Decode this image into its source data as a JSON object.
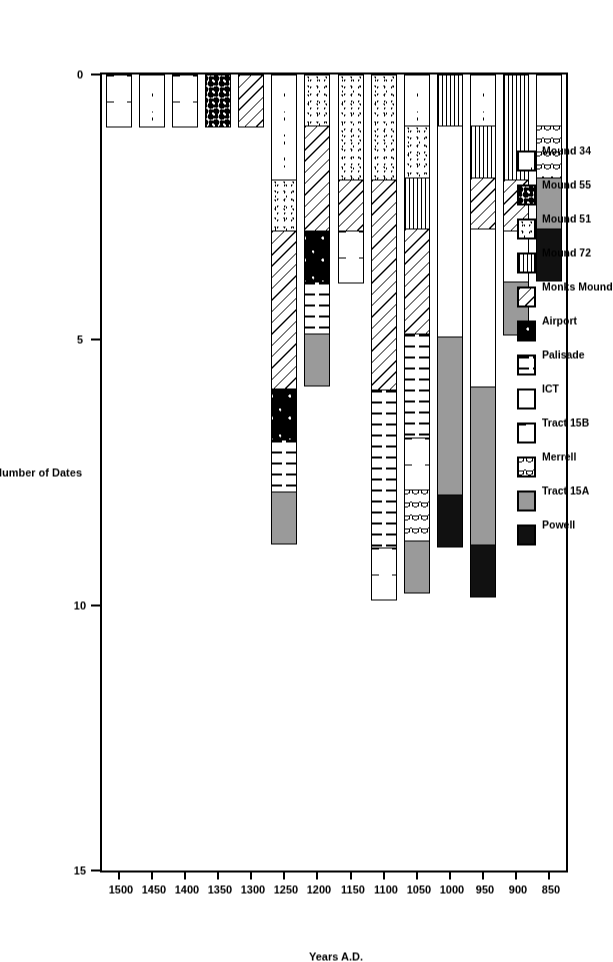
{
  "chart_data": {
    "type": "bar",
    "subtype": "stacked-bar-horizontal-rotated",
    "title": "",
    "xlabel": "Years A.D.",
    "ylabel": "Number of Dates",
    "ylim": [
      0,
      15
    ],
    "yticks": [
      "0",
      "5",
      "10",
      "15"
    ],
    "ytick_values": [
      0,
      5,
      10,
      15
    ],
    "grid": false,
    "legend_position": "upper-left-inside-plot",
    "orientation": "bars extend from the 0 axis; whole figure rotated 90 degrees",
    "categories": [
      "850",
      "900",
      "950",
      "1000",
      "1050",
      "1100",
      "1150",
      "1200",
      "1250",
      "1300",
      "1350",
      "1400",
      "1450",
      "1500"
    ],
    "series": [
      {
        "name": "Mound 34",
        "pattern": "sparse-dashes",
        "values": [
          0,
          0,
          1,
          0,
          1,
          0,
          0,
          0,
          2,
          0,
          0,
          0,
          1,
          0
        ]
      },
      {
        "name": "Mound 55",
        "pattern": "coarse-dots",
        "values": [
          0,
          0,
          0,
          0,
          0,
          0,
          0,
          0,
          0,
          0,
          1,
          0,
          0,
          0
        ]
      },
      {
        "name": "Mound 51",
        "pattern": "fine-stipple",
        "values": [
          0,
          0,
          0,
          0,
          1,
          2,
          2,
          1,
          1,
          0,
          0,
          0,
          0,
          0
        ]
      },
      {
        "name": "Mound 72",
        "pattern": "horizontal-lines",
        "values": [
          0,
          2,
          1,
          1,
          1,
          0,
          0,
          0,
          0,
          0,
          0,
          0,
          0,
          0
        ]
      },
      {
        "name": "Monks Mound",
        "pattern": "diagonal-hatch",
        "values": [
          0,
          1,
          1,
          0,
          2,
          4,
          1,
          2,
          3,
          1,
          0,
          0,
          0,
          0
        ]
      },
      {
        "name": "Airport",
        "pattern": "black-speckled",
        "values": [
          0,
          0,
          0,
          0,
          0,
          0,
          0,
          1,
          1,
          0,
          0,
          0,
          0,
          0
        ]
      },
      {
        "name": "Palisade",
        "pattern": "vertical-dashes",
        "values": [
          0,
          0,
          0,
          0,
          2,
          3,
          0,
          1,
          1,
          0,
          0,
          0,
          0,
          0
        ]
      },
      {
        "name": "ICT",
        "pattern": "plain-white",
        "values": [
          1,
          1,
          3,
          4,
          0,
          0,
          0,
          0,
          0,
          0,
          0,
          0,
          0,
          0
        ]
      },
      {
        "name": "Tract 15B",
        "pattern": "white-ticks",
        "values": [
          0,
          0,
          0,
          0,
          1,
          1,
          1,
          0,
          0,
          0,
          0,
          1,
          0,
          1
        ]
      },
      {
        "name": "Merrell",
        "pattern": "wavy-lines",
        "values": [
          1,
          0,
          0,
          0,
          1,
          0,
          0,
          0,
          0,
          0,
          0,
          0,
          0,
          0
        ]
      },
      {
        "name": "Tract 15A",
        "pattern": "solid-grey",
        "values": [
          1,
          1,
          3,
          3,
          1,
          0,
          0,
          1,
          1,
          0,
          0,
          0,
          0,
          0
        ]
      },
      {
        "name": "Powell",
        "pattern": "solid-black",
        "values": [
          1,
          0,
          1,
          1,
          0,
          0,
          0,
          0,
          0,
          0,
          0,
          0,
          0,
          0
        ]
      }
    ],
    "totals": [
      4,
      5,
      10,
      9,
      10,
      10,
      4,
      6,
      9,
      1,
      1,
      1,
      1,
      1
    ]
  },
  "axes": {
    "x_title": "Years A.D.",
    "y_title": "Number of Dates",
    "x_ticks": [
      "850",
      "900",
      "950",
      "1000",
      "1050",
      "1100",
      "1150",
      "1200",
      "1250",
      "1300",
      "1350",
      "1400",
      "1450",
      "1500"
    ],
    "y_ticks": [
      "15",
      "10",
      "5",
      "0"
    ]
  },
  "legend": {
    "items": [
      {
        "label": "Mound 34"
      },
      {
        "label": "Mound 55"
      },
      {
        "label": "Mound 51"
      },
      {
        "label": "Mound 72"
      },
      {
        "label": "Monks Mound"
      },
      {
        "label": "Airport"
      },
      {
        "label": "Palisade"
      },
      {
        "label": "ICT"
      },
      {
        "label": "Tract 15B"
      },
      {
        "label": "Merrell"
      },
      {
        "label": "Tract 15A"
      },
      {
        "label": "Powell"
      }
    ]
  },
  "colors": {
    "axis": "#000000",
    "plot_background": "#ffffff",
    "tract_15a_grey": "#9a9a9a",
    "powell_black": "#111111"
  }
}
